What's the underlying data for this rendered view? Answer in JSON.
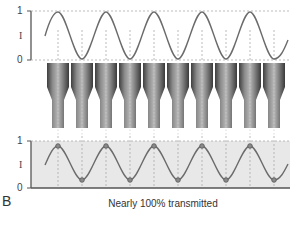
{
  "figure": {
    "panel_letter": "B",
    "caption": "Nearly 100% transmitted",
    "top_plot": {
      "y_label": "I",
      "y_ticks": [
        "1",
        "0"
      ],
      "description": "Incident sinusoidal wave of intensity I oscillating between 0 and 1"
    },
    "horns": {
      "count": 10,
      "description": "Row of ten stepped (tapered) cylindrical elements aligned with wave peaks and troughs"
    },
    "bottom_plot": {
      "y_label": "I",
      "y_ticks": [
        "1",
        "0"
      ],
      "description": "Transmitted sinusoidal wave with circle markers at each peak and trough, shaded background",
      "markers": "circles at peaks and troughs"
    },
    "colors": {
      "wave": "#6b6b6b",
      "grid_dotted": "#aaaaaa",
      "shade": "#e8e8e8",
      "horn_dark": "#4a4a4a",
      "horn_light": "#b5b5b5",
      "axis": "#555555"
    }
  }
}
